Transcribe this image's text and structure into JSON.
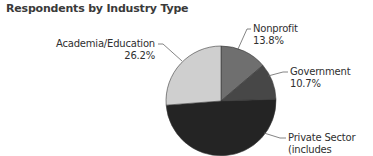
{
  "chart_data": {
    "type": "pie",
    "title": "Respondents by Industry Type",
    "start_angle_deg": 0,
    "direction": "clockwise",
    "slices": [
      {
        "label": "Nonprofit",
        "value": 13.8,
        "value_label": "13.8%",
        "color": "#6f6f6f"
      },
      {
        "label": "Government",
        "value": 10.7,
        "value_label": "10.7%",
        "color": "#474747"
      },
      {
        "label": "Private Sector (includes",
        "value": 49.3,
        "value_label": "",
        "color": "#242424"
      },
      {
        "label": "Academia/Education",
        "value": 26.2,
        "value_label": "26.2%",
        "color": "#cfcfcf"
      }
    ],
    "legend": "none (direct leader-line labels)"
  },
  "labels": {
    "nonprofit": {
      "name": "Nonprofit",
      "pct": "13.8%"
    },
    "government": {
      "name": "Government",
      "pct": "10.7%"
    },
    "private": {
      "name": "Private Sector",
      "name2": "(includes"
    },
    "academia": {
      "name": "Academia/Education",
      "pct": "26.2%"
    }
  }
}
